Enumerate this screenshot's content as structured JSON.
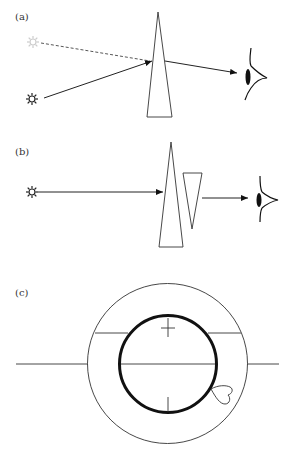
{
  "figure": {
    "panels": [
      {
        "label": "(a)",
        "description": "Light source viewed through a single prism; apparent source displaced",
        "elements": [
          "light-source",
          "apparent-light-source",
          "prism",
          "eye"
        ]
      },
      {
        "label": "(b)",
        "description": "Two opposed prisms; light passes straight through to eye",
        "elements": [
          "light-source",
          "prism",
          "inverted-prism",
          "eye"
        ]
      },
      {
        "label": "(c)",
        "description": "Concentric circles with crosshair chords and a heart-shaped mark",
        "elements": [
          "outer-circle",
          "inner-thick-circle",
          "horizontal-line",
          "chord-lines",
          "tick-marks",
          "heart-mark"
        ]
      }
    ],
    "colors": {
      "line": "#333333",
      "thick_line": "#111111",
      "ghost_source": "#cccccc",
      "background": "#ffffff"
    }
  }
}
